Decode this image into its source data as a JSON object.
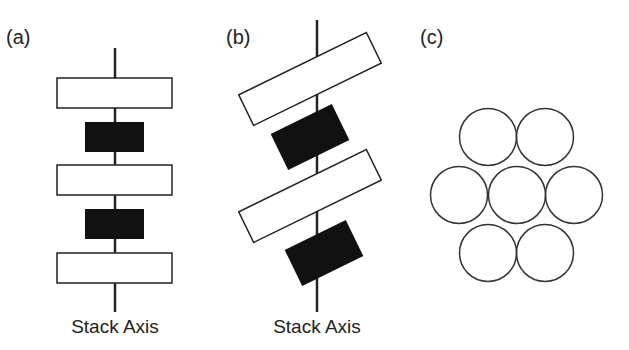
{
  "panels": [
    {
      "id": "a",
      "label": "(a)",
      "caption": "Stack Axis"
    },
    {
      "id": "b",
      "label": "(b)",
      "caption": "Stack Axis"
    },
    {
      "id": "c",
      "label": "(c)"
    }
  ],
  "colors": {
    "stroke": "#222222",
    "dark_block": "#111111",
    "light_block": "#ffffff"
  }
}
